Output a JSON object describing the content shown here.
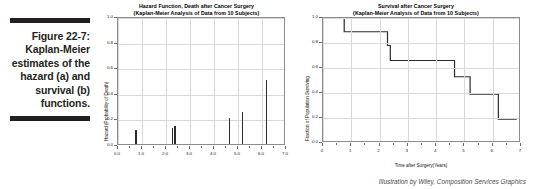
{
  "caption": {
    "label": "Figure 22-7:",
    "body": "Kaplan-Meier estimates of the hazard (a) and survival (b) functions.",
    "rule_color": "#231f20"
  },
  "credit": {
    "text": "Illustration by Wiley, Composition Services Graphics"
  },
  "chart_data": [
    {
      "id": "hazard",
      "type": "bar",
      "title": "Hazard Function, Death after Cancer Surgery",
      "subtitle": "(Kaplan-Meier Analysis of Data from 10 Subjects)",
      "xlabel": "",
      "ylabel": "Hazard (Probability of Death)",
      "xlim": [
        0.0,
        7.0
      ],
      "ylim": [
        0.0,
        1.0
      ],
      "xticks": [
        "0.0",
        "1.0",
        "2.0",
        "3.0",
        "4.0",
        "5.0",
        "6.0",
        "7.0"
      ],
      "xtick_values": [
        0.0,
        1.0,
        2.0,
        3.0,
        4.0,
        5.0,
        6.0,
        7.0
      ],
      "yticks": [
        "0.0",
        "0.2",
        "0.4",
        "0.6",
        "0.8",
        "1.0"
      ],
      "ytick_values": [
        0.0,
        0.2,
        0.4,
        0.6,
        0.8,
        1.0
      ],
      "grid": true,
      "legend": "none",
      "x": [
        0.75,
        2.28,
        2.38,
        4.65,
        5.2,
        6.2
      ],
      "values": [
        0.11,
        0.125,
        0.143,
        0.2,
        0.25,
        0.5
      ]
    },
    {
      "id": "survival",
      "type": "line",
      "title": "Survival after Cancer Surgery",
      "subtitle": "(Kaplan-Meier Analysis of Data from 10 Subjects)",
      "xlabel": "Time after Surgery(Years)",
      "ylabel": "Fraction of Population Surviving",
      "xlim": [
        0,
        7
      ],
      "ylim": [
        0.0,
        1.0
      ],
      "xticks": [
        "0",
        "1",
        "2",
        "3",
        "4",
        "5",
        "6",
        "7"
      ],
      "xtick_values": [
        0,
        1,
        2,
        3,
        4,
        5,
        6,
        7
      ],
      "yticks": [
        "0.0",
        "0.2",
        "0.4",
        "0.6",
        "0.8",
        "1.0"
      ],
      "ytick_values": [
        0.0,
        0.2,
        0.4,
        0.6,
        0.8,
        1.0
      ],
      "grid": true,
      "legend": "none",
      "step": "post",
      "x": [
        0.0,
        0.75,
        2.28,
        2.38,
        4.65,
        5.2,
        6.2,
        6.85
      ],
      "values": [
        1.0,
        0.89,
        0.78,
        0.66,
        0.53,
        0.39,
        0.19,
        0.19
      ]
    }
  ]
}
